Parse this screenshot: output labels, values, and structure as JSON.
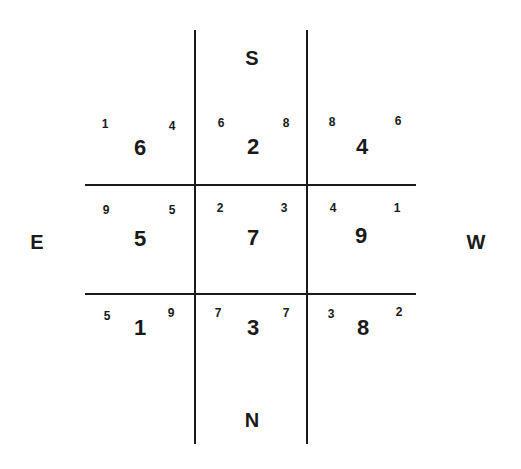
{
  "diagram": {
    "compass": {
      "top": "S",
      "bottom": "N",
      "left": "E",
      "right": "W"
    },
    "grid": [
      {
        "position": "top-left",
        "main": "6",
        "left": "1",
        "right": "4"
      },
      {
        "position": "top-center",
        "main": "2",
        "left": "6",
        "right": "8"
      },
      {
        "position": "top-right",
        "main": "4",
        "left": "8",
        "right": "6"
      },
      {
        "position": "middle-left",
        "main": "5",
        "left": "9",
        "right": "5"
      },
      {
        "position": "center",
        "main": "7",
        "left": "2",
        "right": "3"
      },
      {
        "position": "middle-right",
        "main": "9",
        "left": "4",
        "right": "1"
      },
      {
        "position": "bottom-left",
        "main": "1",
        "left": "5",
        "right": "9"
      },
      {
        "position": "bottom-center",
        "main": "3",
        "left": "7",
        "right": "7"
      },
      {
        "position": "bottom-right",
        "main": "8",
        "left": "3",
        "right": "2"
      }
    ]
  }
}
